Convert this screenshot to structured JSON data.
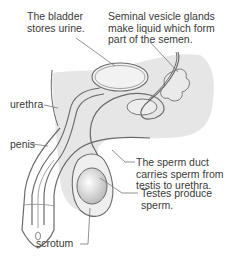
{
  "diagram": {
    "type": "anatomical-illustration",
    "labels": {
      "bladder": "The bladder\nstores urine.",
      "seminal_vesicle": "Seminal vesicle glands\nmake liquid which form\npart of the semen.",
      "urethra": "urethra",
      "penis": "penis",
      "sperm_duct": "The sperm duct\ncarries sperm from\ntestis to urethra.",
      "testes": "Testes produce\nsperm.",
      "scrotum": "scrotum"
    },
    "colors": {
      "body_fill": "#e6e6e6",
      "outline": "#6b6b6b",
      "leader_line": "#777777",
      "testis_fill": "#d4d4d4"
    }
  }
}
